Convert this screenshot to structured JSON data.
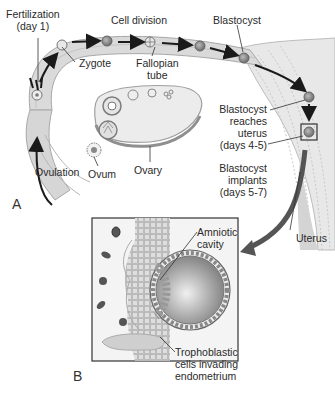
{
  "figure": {
    "panels": {
      "a": "A",
      "b": "B"
    },
    "labels": {
      "fertilization_line1": "Fertilization",
      "fertilization_line2": "(day 1)",
      "cell_division": "Cell division",
      "blastocyst": "Blastocyst",
      "zygote": "Zygote",
      "fallopian_line1": "Fallopian",
      "fallopian_line2": "tube",
      "blastocyst_reaches_line1": "Blastocyst",
      "blastocyst_reaches_line2": "reaches",
      "blastocyst_reaches_line3": "uterus",
      "blastocyst_reaches_line4": "(days 4-5)",
      "blastocyst_implants_line1": "Blastocyst",
      "blastocyst_implants_line2": "implants",
      "blastocyst_implants_line3": "(days 5-7)",
      "ovulation": "Ovulation",
      "ovum": "Ovum",
      "ovary": "Ovary",
      "uterus": "Uterus",
      "amniotic_line1": "Amniotic",
      "amniotic_line2": "cavity",
      "tropho_line1": "Trophoblastic",
      "tropho_line2": "cells invading",
      "tropho_line3": "endometrium"
    },
    "colors": {
      "tube_fill": "#d9d9d9",
      "tube_edge": "#a8a8a8",
      "arrow": "#1a1a1a",
      "big_arrow": "#555555",
      "uterus_fill": "#e6e6e6",
      "cells": "#bdbdbd",
      "blastocyst_fill": "#9a9a9a"
    }
  }
}
